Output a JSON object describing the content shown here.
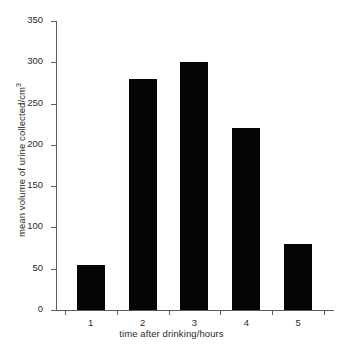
{
  "chart_data": {
    "type": "bar",
    "title": "",
    "xlabel": "time after drinking/hours",
    "ylabel": "mean volume of urine collected/cm3",
    "ylabel_base": "mean volume of urine collected/cm",
    "ylabel_sup": "3",
    "categories": [
      "1",
      "2",
      "3",
      "4",
      "5"
    ],
    "values": [
      55,
      280,
      300,
      220,
      80
    ],
    "ylim": [
      0,
      350
    ],
    "ytick_labels": [
      "0",
      "50",
      "100",
      "150",
      "200",
      "250",
      "300",
      "350"
    ],
    "ytick_values": [
      0,
      50,
      100,
      150,
      200,
      250,
      300,
      350
    ],
    "grid": false,
    "legend": false,
    "bar_color": "#050505",
    "axis_color": "#5d5d5d",
    "background_color": "#ffffff"
  }
}
